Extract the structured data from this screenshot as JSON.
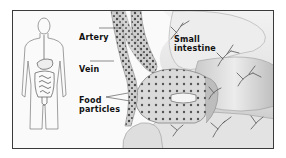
{
  "diagram": {
    "inset": {
      "figure": "human-torso-outline",
      "highlighted_organs": [
        "esophagus",
        "stomach",
        "small-intestine",
        "large-intestine"
      ]
    },
    "labels": {
      "artery": "Artery",
      "vein": "Vein",
      "food_particles_line1": "Food",
      "food_particles_line2": "particles",
      "small_intestine_line1": "Small",
      "small_intestine_line2": "intestine"
    },
    "colors": {
      "frame": "#3a3a3a",
      "background": "#ffffff",
      "intestine_fill": "#e6e6e6",
      "intestine_shadow": "#a8a8a8",
      "vessel_fill": "#cfcfcf",
      "particle_dot": "#4a4a4a",
      "vein_branches": "#555555",
      "label_text": "#111111"
    }
  }
}
